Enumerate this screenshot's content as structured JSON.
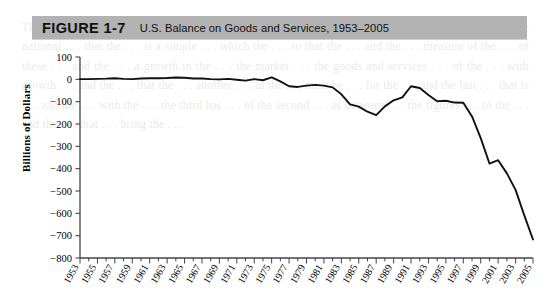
{
  "figure": {
    "label": "FIGURE 1-7",
    "title": "U.S. Balance on Goods and Services, 1953–2005",
    "banner_color": "#b2b2b2"
  },
  "axis": {
    "y_title": "Billions of Dollars",
    "y_ticks": [
      "100",
      "0",
      "−100",
      "−200",
      "−300",
      "−400",
      "−500",
      "−600",
      "−700",
      "−800"
    ],
    "x_ticks": [
      "1953",
      "1955",
      "1957",
      "1959",
      "1961",
      "1963",
      "1965",
      "1967",
      "1969",
      "1971",
      "1973",
      "1975",
      "1977",
      "1979",
      "1981",
      "1983",
      "1985",
      "1987",
      "1989",
      "1991",
      "1993",
      "1995",
      "1997",
      "1999",
      "2001",
      "2003",
      "2005"
    ]
  },
  "colors": {
    "line": "#111111",
    "axis": "#444444",
    "banner": "#b2b2b2",
    "background": "#ffffff"
  },
  "ghost_text": "The Origins of . . . the only . . . of this . . . it is possible . . . trade and . . . of the . . . in the . . . of the national . . . that the . . . is a simple . . . which the . . . so that the . . . and the . . . measure of the . . . of these . . . and the . . . a growth in the . . . the market . . . the goods and services . . . of the . . . with growth . . . and the . . . that the . . . another . . . in the . . . must be . . . for the . . . and the last . . . that is . . . and the . . . with the . . . the third has . . . of the second . . . as between . . . the figures . . . to the . . . and the . . . that . . . bring the . . .",
  "chart_data": {
    "type": "line",
    "title": "U.S. Balance on Goods and Services, 1953–2005",
    "xlabel": "",
    "ylabel": "Billions of Dollars",
    "ylim": [
      -800,
      100
    ],
    "xlim": [
      1953,
      2005
    ],
    "grid": false,
    "legend": "none",
    "y_tick_values": [
      100,
      0,
      -100,
      -200,
      -300,
      -400,
      -500,
      -600,
      -700,
      -800
    ],
    "x_tick_values": [
      1953,
      1955,
      1957,
      1959,
      1961,
      1963,
      1965,
      1967,
      1969,
      1971,
      1973,
      1975,
      1977,
      1979,
      1981,
      1983,
      1985,
      1987,
      1989,
      1991,
      1993,
      1995,
      1997,
      1999,
      2001,
      2003,
      2005
    ],
    "series": [
      {
        "name": "U.S. Balance on Goods and Services",
        "x": [
          1953,
          1954,
          1955,
          1956,
          1957,
          1958,
          1959,
          1960,
          1961,
          1962,
          1963,
          1964,
          1965,
          1966,
          1967,
          1968,
          1969,
          1970,
          1971,
          1972,
          1973,
          1974,
          1975,
          1976,
          1977,
          1978,
          1979,
          1980,
          1981,
          1982,
          1983,
          1984,
          1985,
          1986,
          1987,
          1988,
          1989,
          1990,
          1991,
          1992,
          1993,
          1994,
          1995,
          1996,
          1997,
          1998,
          1999,
          2000,
          2001,
          2002,
          2003,
          2004,
          2005
        ],
        "values": [
          1,
          1,
          2,
          3,
          5,
          2,
          1,
          4,
          5,
          5,
          6,
          8,
          7,
          4,
          4,
          1,
          0,
          2,
          -2,
          -6,
          1,
          -4,
          9,
          -9,
          -31,
          -34,
          -28,
          -25,
          -28,
          -36,
          -67,
          -112,
          -122,
          -145,
          -160,
          -121,
          -94,
          -81,
          -31,
          -39,
          -70,
          -98,
          -96,
          -104,
          -105,
          -166,
          -263,
          -377,
          -362,
          -421,
          -495,
          -609,
          -717
        ]
      }
    ]
  }
}
